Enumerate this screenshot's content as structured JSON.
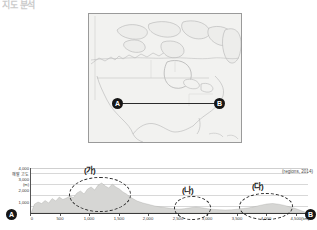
{
  "header": {
    "question_label": "지도 분석"
  },
  "map": {
    "title": "북아메리카 지형도",
    "point_a": "A",
    "point_b": "B",
    "transect_line": "A-B 단면선"
  },
  "chart_data": {
    "type": "area",
    "title": "",
    "xlabel": "",
    "ylabel": "해발 고도",
    "ylabel_unit": "(m)",
    "source": "(regions, 2014)",
    "xlim": [
      0,
      4700
    ],
    "ylim": [
      0,
      4500
    ],
    "grid": true,
    "legend_position": "none",
    "y_ticks": [
      "4,000",
      "3,000",
      "2,000",
      "1,000"
    ],
    "y_tick_values": [
      4000,
      3000,
      2000,
      1000
    ],
    "x_ticks": [
      "0",
      "500",
      "1,000",
      "1,500",
      "2,000",
      "2,500",
      "3,000",
      "3,500",
      "4,000",
      "4,500(km)"
    ],
    "x_tick_values": [
      0,
      500,
      1000,
      1500,
      2000,
      2500,
      3000,
      3500,
      4000,
      4500
    ],
    "endpoint_left": "A",
    "endpoint_right": "B",
    "series": [
      {
        "name": "해발 고도 단면",
        "x": [
          0,
          60,
          120,
          180,
          240,
          300,
          360,
          420,
          480,
          540,
          600,
          660,
          720,
          780,
          840,
          900,
          960,
          1020,
          1080,
          1140,
          1200,
          1260,
          1320,
          1380,
          1440,
          1500,
          1560,
          1620,
          1680,
          1740,
          1800,
          1900,
          2000,
          2100,
          2200,
          2300,
          2400,
          2500,
          2600,
          2700,
          2800,
          2900,
          3000,
          3100,
          3200,
          3300,
          3400,
          3500,
          3600,
          3700,
          3800,
          3900,
          4000,
          4100,
          4200,
          4300,
          4400,
          4500,
          4600,
          4700
        ],
        "values": [
          0,
          900,
          1100,
          950,
          1250,
          1000,
          1450,
          1200,
          1600,
          1350,
          1500,
          1700,
          1550,
          2000,
          2200,
          1900,
          2400,
          2600,
          2300,
          2800,
          3000,
          2700,
          2500,
          2900,
          2600,
          2400,
          2100,
          1900,
          1600,
          1400,
          1200,
          1000,
          850,
          700,
          600,
          520,
          450,
          380,
          430,
          520,
          600,
          520,
          430,
          360,
          320,
          300,
          320,
          380,
          450,
          520,
          640,
          780,
          900,
          950,
          880,
          760,
          600,
          420,
          200,
          0
        ]
      }
    ],
    "annotations": [
      {
        "id": "ga",
        "label": "(가)",
        "x_start": 700,
        "x_end": 1650,
        "note": "로키 산맥"
      },
      {
        "id": "na",
        "label": "(나)",
        "x_start": 2450,
        "x_end": 3000,
        "note": "중앙 평원"
      },
      {
        "id": "da",
        "label": "(다)",
        "x_start": 3850,
        "x_end": 4550,
        "note": "애팔래치아 산맥"
      }
    ]
  }
}
